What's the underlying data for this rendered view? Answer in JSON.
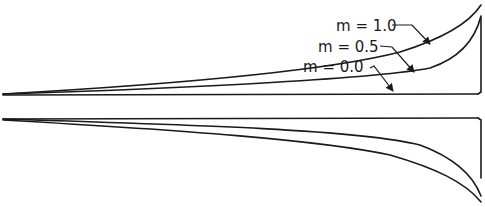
{
  "diagram": {
    "type": "profile-curves",
    "labels": [
      {
        "id": "m10",
        "text": "m = 1.0",
        "value": 1.0
      },
      {
        "id": "m05",
        "text": "m = 0.5",
        "value": 0.5
      },
      {
        "id": "m00",
        "text": "m = 0.0",
        "value": 0.0
      }
    ],
    "panels": [
      {
        "name": "upper-profile",
        "curves": [
          "m = 1.0",
          "m = 0.5",
          "m = 0.0"
        ]
      },
      {
        "name": "lower-profile",
        "curves": [
          "m = 1.0",
          "m = 0.5"
        ]
      }
    ],
    "colors": {
      "ink": "#1a1a1a",
      "background": "#ffffff"
    }
  }
}
